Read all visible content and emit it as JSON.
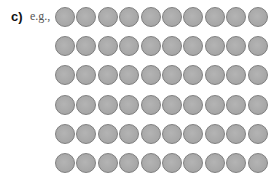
{
  "item_label": "c)",
  "example_text": "e.g.,",
  "dots": {
    "rows": 6,
    "cols": 10,
    "fill": "#a9a9a9",
    "border": "#7f7f7f"
  }
}
